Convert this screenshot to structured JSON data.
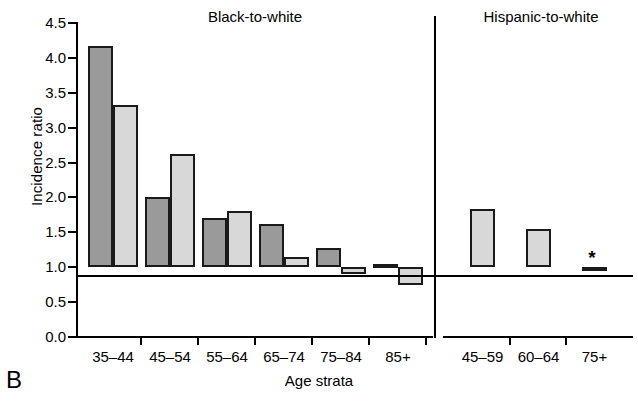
{
  "panel_label": "B",
  "chart_data": {
    "type": "bar",
    "title": "",
    "xlabel": "Age strata",
    "ylabel": "Incidence ratio",
    "ylim": [
      0.0,
      4.5
    ],
    "yticks": [
      "0.0",
      "0.5",
      "1.0",
      "1.5",
      "2.0",
      "2.5",
      "3.0",
      "3.5",
      "4.0",
      "4.5"
    ],
    "ytick_values": [
      0.0,
      0.5,
      1.0,
      1.5,
      2.0,
      2.5,
      3.0,
      3.5,
      4.0,
      4.5
    ],
    "reference_line": 1.0,
    "grid": false,
    "legend_position": "none",
    "panels": [
      {
        "name": "black-to-white",
        "title": "Black-to-white",
        "categories": [
          "35–44",
          "45–54",
          "55–64",
          "65–74",
          "75–84",
          "85+"
        ],
        "series": [
          {
            "name": "dark",
            "color": "#9a9a9a",
            "values": [
              4.17,
              2.01,
              1.7,
              1.62,
              1.28,
              1.05
            ]
          },
          {
            "name": "light",
            "color": "#d8d8d8",
            "values": [
              3.32,
              2.62,
              1.8,
              1.15,
              0.9,
              0.75
            ]
          }
        ]
      },
      {
        "name": "hispanic-to-white",
        "title": "Hispanic-to-white",
        "categories": [
          "45–59",
          "60–64",
          "75+"
        ],
        "series": [
          {
            "name": "light",
            "color": "#d8d8d8",
            "values": [
              1.84,
              1.55,
              0.99
            ]
          }
        ],
        "annotations": [
          {
            "category": "75+",
            "symbol": "*"
          }
        ]
      }
    ]
  }
}
